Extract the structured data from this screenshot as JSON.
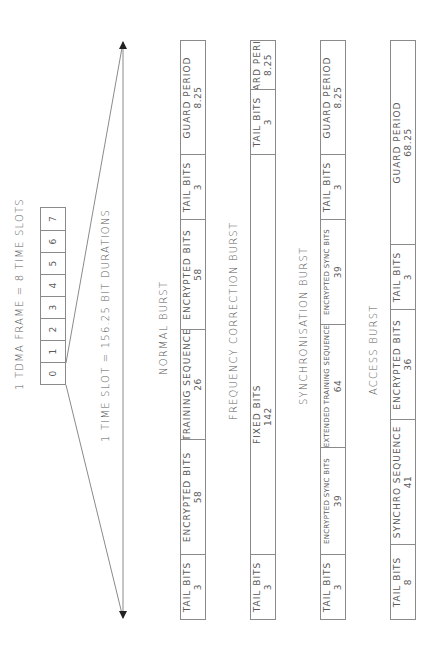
{
  "header": {
    "frame_label": "1 TDMA FRAME = 8 TIME SLOTS",
    "slot_label": "1 TIME SLOT = 156.25 BIT DURATIONS"
  },
  "slots": [
    "0",
    "1",
    "2",
    "3",
    "4",
    "5",
    "6",
    "7"
  ],
  "bursts": [
    {
      "title": "NORMAL BURST",
      "fields": [
        {
          "name": "TAIL BITS",
          "value": "3"
        },
        {
          "name": "ENCRYPTED BITS",
          "value": "58"
        },
        {
          "name": "TRAINING SEQUENCE",
          "value": "26"
        },
        {
          "name": "ENCRYPTED BITS",
          "value": "58"
        },
        {
          "name": "TAIL BITS",
          "value": "3"
        },
        {
          "name": "GUARD PERIOD",
          "value": "8.25"
        }
      ]
    },
    {
      "title": "FREQUENCY CORRECTION BURST",
      "fields": [
        {
          "name": "TAIL BITS",
          "value": "3"
        },
        {
          "name": "FIXED BITS",
          "value": "142"
        },
        {
          "name": "TAIL BITS",
          "value": "3"
        },
        {
          "name": "GUARD PERIOD",
          "value": "8.25"
        }
      ]
    },
    {
      "title": "SYNCHRONISATION BURST",
      "fields": [
        {
          "name": "TAIL BITS",
          "value": "3"
        },
        {
          "name": "ENCRYPTED SYNC BITS",
          "value": "39"
        },
        {
          "name": "EXTENDED TRAINING SEQUENCE",
          "value": "64"
        },
        {
          "name": "ENCRYPTED SYNC BITS",
          "value": "39"
        },
        {
          "name": "TAIL BITS",
          "value": "3"
        },
        {
          "name": "GUARD PERIOD",
          "value": "8.25"
        }
      ]
    },
    {
      "title": "ACCESS BURST",
      "fields": [
        {
          "name": "TAIL BITS",
          "value": "8"
        },
        {
          "name": "SYNCHRO SEQUENCE",
          "value": "41"
        },
        {
          "name": "ENCRYPTED BITS",
          "value": "36"
        },
        {
          "name": "TAIL BITS",
          "value": "3"
        },
        {
          "name": "GUARD PERIOD",
          "value": "68.25"
        }
      ]
    }
  ],
  "colors": {
    "line": "#8a8a8a",
    "arrow": "#222222",
    "text": "#5a5a5a"
  }
}
